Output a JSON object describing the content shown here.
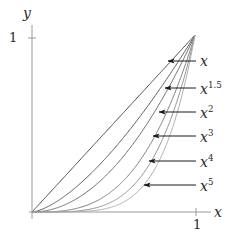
{
  "figure": {
    "title": "",
    "background_color": "#ffffff",
    "axis_color": "#8f8f8f",
    "text_color": "#2b2b2b",
    "arrow_color": "#1a1a1a"
  },
  "axes": {
    "x_axis_label": "x",
    "y_axis_label": "y",
    "x_tick_label": "1",
    "y_tick_label": "1"
  },
  "curve_labels": [
    {
      "base": "x",
      "exponent": ""
    },
    {
      "base": "x",
      "exponent": "1.5"
    },
    {
      "base": "x",
      "exponent": "2"
    },
    {
      "base": "x",
      "exponent": "3"
    },
    {
      "base": "x",
      "exponent": "4"
    },
    {
      "base": "x",
      "exponent": "5"
    }
  ],
  "chart_data": {
    "type": "line",
    "title": "",
    "xlabel": "x",
    "ylabel": "y",
    "xlim": [
      0,
      1
    ],
    "ylim": [
      0,
      1
    ],
    "xticks": [
      1
    ],
    "xticklabels": [
      "1"
    ],
    "yticks": [
      1
    ],
    "yticklabels": [
      "1"
    ],
    "grid": false,
    "legend": "annotated-arrows-right",
    "x": [
      0,
      0.05,
      0.1,
      0.15,
      0.2,
      0.25,
      0.3,
      0.35,
      0.4,
      0.45,
      0.5,
      0.55,
      0.6,
      0.65,
      0.7,
      0.75,
      0.8,
      0.85,
      0.9,
      0.95,
      1
    ],
    "series": [
      {
        "name": "x",
        "exponent": 1,
        "color": "#4a4a4a",
        "values": [
          0,
          0.05,
          0.1,
          0.15,
          0.2,
          0.25,
          0.3,
          0.35,
          0.4,
          0.45,
          0.5,
          0.55,
          0.6,
          0.65,
          0.7,
          0.75,
          0.8,
          0.85,
          0.9,
          0.95,
          1
        ]
      },
      {
        "name": "x^1.5",
        "exponent": 1.5,
        "color": "#5c5c5c",
        "values": [
          0,
          0.0112,
          0.0316,
          0.0581,
          0.0894,
          0.125,
          0.1643,
          0.2071,
          0.253,
          0.3018,
          0.3536,
          0.4079,
          0.4648,
          0.5241,
          0.5857,
          0.6495,
          0.7155,
          0.7835,
          0.8538,
          0.926,
          1
        ]
      },
      {
        "name": "x^2",
        "exponent": 2,
        "color": "#6e6e6e",
        "values": [
          0,
          0.0025,
          0.01,
          0.0225,
          0.04,
          0.0625,
          0.09,
          0.1225,
          0.16,
          0.2025,
          0.25,
          0.3025,
          0.36,
          0.4225,
          0.49,
          0.5625,
          0.64,
          0.7225,
          0.81,
          0.9025,
          1
        ]
      },
      {
        "name": "x^3",
        "exponent": 3,
        "color": "#828282",
        "values": [
          0,
          0.000125,
          0.001,
          0.0034,
          0.008,
          0.0156,
          0.027,
          0.0429,
          0.064,
          0.0911,
          0.125,
          0.1664,
          0.216,
          0.2746,
          0.343,
          0.4219,
          0.512,
          0.6141,
          0.729,
          0.8574,
          1
        ]
      },
      {
        "name": "x^4",
        "exponent": 4,
        "color": "#969696",
        "values": [
          0,
          6.25e-06,
          0.0001,
          0.000506,
          0.0016,
          0.0039,
          0.0081,
          0.015,
          0.0256,
          0.041,
          0.0625,
          0.0915,
          0.1296,
          0.1785,
          0.2401,
          0.3164,
          0.4096,
          0.522,
          0.6561,
          0.8145,
          1
        ]
      },
      {
        "name": "x^5",
        "exponent": 5,
        "color": "#b0b0b0",
        "values": [
          0,
          3e-07,
          1e-05,
          7.59e-05,
          0.00032,
          0.000977,
          0.00243,
          0.00525,
          0.01024,
          0.01845,
          0.03125,
          0.0503,
          0.07776,
          0.116,
          0.16807,
          0.2373,
          0.32768,
          0.4437,
          0.59049,
          0.7738,
          1
        ]
      }
    ]
  }
}
